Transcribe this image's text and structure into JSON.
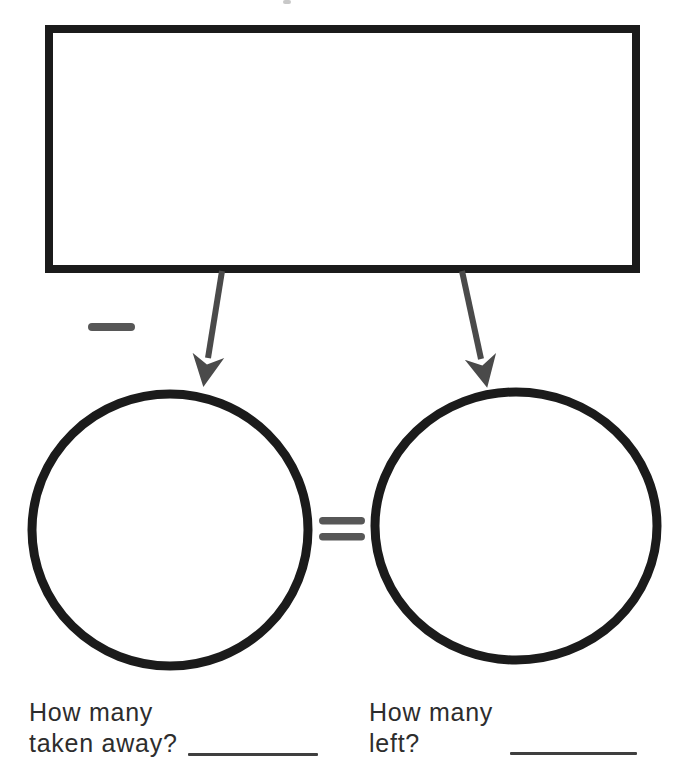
{
  "worksheet": {
    "type": "subtraction-graphic-organizer",
    "colors": {
      "outline_black": "#1b1b1b",
      "arrow_gray": "#4a4a4a",
      "symbol_gray": "#575757",
      "text_dark": "#2d2d2d",
      "blank_line": "#3f3f3f",
      "background": "#ffffff"
    },
    "symbols": {
      "minus": "−",
      "equals": "="
    },
    "questions": {
      "left": {
        "line1": "How many",
        "line2": "taken away?"
      },
      "right": {
        "line1": "How many",
        "line2": "left?"
      }
    }
  }
}
